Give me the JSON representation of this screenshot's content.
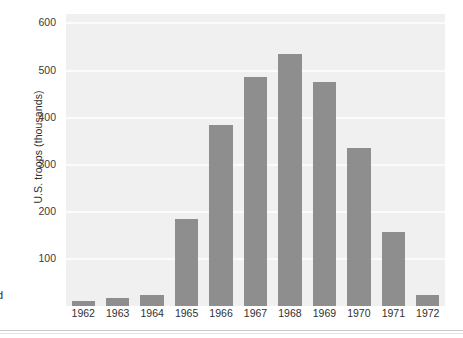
{
  "figure": {
    "background_color": "#ffffff",
    "plot_background_color": "#f0f0f0",
    "gridline_color": "#fbfbfb",
    "bar_color": "#8e8e8e",
    "axis_text_color": "#2f2f2f",
    "margin_fragment_text": "d"
  },
  "chart_data": {
    "type": "bar",
    "title": "",
    "xlabel": "",
    "ylabel": "U.S. troops (thousands)",
    "categories": [
      "1962",
      "1963",
      "1964",
      "1965",
      "1966",
      "1967",
      "1968",
      "1969",
      "1970",
      "1971",
      "1972"
    ],
    "values": [
      11,
      16,
      23,
      184,
      385,
      486,
      536,
      475,
      335,
      157,
      24
    ],
    "ylim": [
      0,
      620
    ],
    "yticks": [
      100,
      200,
      300,
      400,
      500,
      600
    ],
    "ytick_labels": [
      "100",
      "200",
      "300",
      "400",
      "500",
      "600"
    ],
    "grid": true,
    "grid_axis": "y",
    "legend": false,
    "legend_position": "none",
    "bar_color": "#8e8e8e",
    "series": [
      {
        "name": "U.S. troops (thousands)",
        "values": [
          11,
          16,
          23,
          184,
          385,
          486,
          536,
          475,
          335,
          157,
          24
        ]
      }
    ]
  }
}
